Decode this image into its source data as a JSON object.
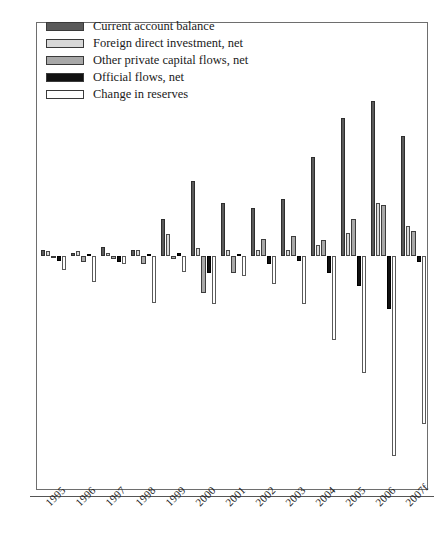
{
  "chart_data": {
    "type": "bar",
    "title": "",
    "subtitle": "",
    "xlabel": "",
    "ylabel": "",
    "ylim": [
      -150,
      150
    ],
    "yticks": [
      150,
      100,
      50,
      0,
      -50,
      -100,
      -150
    ],
    "grid": false,
    "legend_position": "top-left",
    "categories": [
      "1995",
      "1996",
      "1997",
      "1998",
      "1999",
      "2000",
      "2001",
      "2002",
      "2003",
      "2004",
      "2005",
      "2006",
      "2007f"
    ],
    "series": [
      {
        "name": "Current account balance",
        "color": "#5a5a5a",
        "values": [
          4,
          2,
          6,
          4,
          24,
          48,
          34,
          31,
          37,
          64,
          89,
          100,
          77
        ]
      },
      {
        "name": "Foreign direct investment, net",
        "color": "#d8d8d8",
        "values": [
          3,
          3,
          2,
          4,
          14,
          5,
          4,
          4,
          4,
          7,
          15,
          34,
          19
        ]
      },
      {
        "name": "Other private capital flows, net",
        "color": "#a8a8a8",
        "values": [
          -1,
          -4,
          -2,
          -5,
          -2,
          -24,
          -11,
          11,
          13,
          10,
          24,
          33,
          16
        ]
      },
      {
        "name": "Official flows, net",
        "color": "#111111",
        "values": [
          -3,
          1,
          -4,
          1,
          2,
          -11,
          1,
          -5,
          -3,
          -11,
          -19,
          -34,
          -4
        ]
      },
      {
        "name": "Change in reserves",
        "color": "#ffffff",
        "values": [
          -9,
          -17,
          -5,
          -30,
          -10,
          -31,
          -13,
          -18,
          -31,
          -54,
          -75,
          -129,
          -108
        ]
      }
    ]
  },
  "legend": {
    "items": [
      {
        "label": "Current account balance",
        "swatch": "legend-swatch-current-account"
      },
      {
        "label": "Foreign direct investment, net",
        "swatch": "legend-swatch-fdi"
      },
      {
        "label": "Other private capital flows, net",
        "swatch": "legend-swatch-other-private"
      },
      {
        "label": "Official flows, net",
        "swatch": "legend-swatch-official"
      },
      {
        "label": "Change in reserves",
        "swatch": "legend-swatch-reserves"
      }
    ]
  },
  "axes": {
    "y_tick_labels": [
      "150",
      "100",
      "50",
      "0",
      "-50",
      "-100",
      "-150"
    ],
    "x_tick_labels": [
      "1995",
      "1996",
      "1997",
      "1998",
      "1999",
      "2000",
      "2001",
      "2002",
      "2003",
      "2004",
      "2005",
      "2006",
      "2007f"
    ]
  }
}
